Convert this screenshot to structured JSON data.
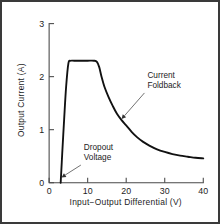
{
  "figure": {
    "background_color": "#ffffff",
    "border_color": "#3a3a3a",
    "curve_color": "#111111",
    "axis_color": "#4a4a4a",
    "text_color": "#1d1d1d",
    "leader_color": "#555555"
  },
  "chart_data": {
    "type": "line",
    "title": "",
    "xlabel": "Input−Output Differential  (V)",
    "ylabel": "Output Current  (A)",
    "xlim": [
      0,
      40
    ],
    "ylim": [
      0,
      3
    ],
    "xticks": [
      0,
      10,
      20,
      30,
      40
    ],
    "xtick_labels": [
      "0",
      "10",
      "20",
      "30",
      "40"
    ],
    "yticks": [
      0,
      1,
      2,
      3
    ],
    "ytick_labels": [
      "0",
      "1",
      "2",
      "3"
    ],
    "grid": false,
    "legend": null,
    "series": [
      {
        "name": "Output current vs input-output differential",
        "x": [
          3.0,
          3.4,
          3.9,
          4.4,
          5.0,
          5.6,
          6.5,
          8.0,
          10.0,
          11.6,
          12.4,
          13.0,
          13.6,
          14.4,
          15.4,
          16.5,
          17.6,
          18.8,
          20.0,
          21.4,
          22.8,
          24.4,
          26.0,
          28.0,
          30.0,
          32.0,
          34.0,
          36.0,
          38.0,
          40.0
        ],
        "y": [
          0.0,
          0.55,
          1.2,
          1.8,
          2.25,
          2.3,
          2.3,
          2.3,
          2.3,
          2.3,
          2.28,
          2.18,
          2.0,
          1.8,
          1.62,
          1.45,
          1.3,
          1.18,
          1.08,
          0.96,
          0.86,
          0.77,
          0.7,
          0.63,
          0.58,
          0.54,
          0.51,
          0.49,
          0.47,
          0.46
        ]
      }
    ],
    "annotations": [
      {
        "id": "current-foldback",
        "lines": [
          "Current",
          "Foldback"
        ],
        "text_x": 25.5,
        "text_y": 1.98,
        "target_x": 18.8,
        "target_y": 1.2
      },
      {
        "id": "dropout-voltage",
        "lines": [
          "Dropout",
          "Voltage"
        ],
        "text_x": 9.0,
        "text_y": 0.62,
        "target_x": 3.2,
        "target_y": 0.1
      }
    ],
    "key_values": {
      "dropout_voltage_v": 3.0,
      "plateau_current_a": 2.3,
      "plateau_start_v": 5.0,
      "plateau_end_v": 12.4,
      "tail_current_a": 0.46
    }
  }
}
